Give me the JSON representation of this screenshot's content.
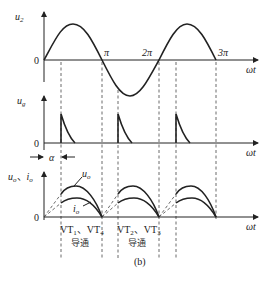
{
  "figure": {
    "caption": "(b)",
    "x_axis_label": "ωt",
    "origin_label": "0",
    "panels": [
      {
        "id": "u2",
        "y_label": "u",
        "y_sub": "2",
        "tick_labels": [
          "π",
          "2π",
          "3π"
        ]
      },
      {
        "id": "ug",
        "y_label": "u",
        "y_sub": "g",
        "origin_label": "0"
      },
      {
        "id": "uo_io",
        "y_label": "u",
        "y_sub": "o",
        "y_label2": "i",
        "y_sub2": "o",
        "separator": "、",
        "curve_labels": {
          "uo": "u",
          "uo_sub": "o",
          "io": "i",
          "io_sub": "o"
        },
        "origin_label": "0"
      }
    ],
    "alpha_label": "α",
    "conduction": [
      {
        "devices": "VT₁、VT₄",
        "state": "导通"
      },
      {
        "devices": "VT₂、VT₃",
        "state": "导通"
      }
    ]
  }
}
